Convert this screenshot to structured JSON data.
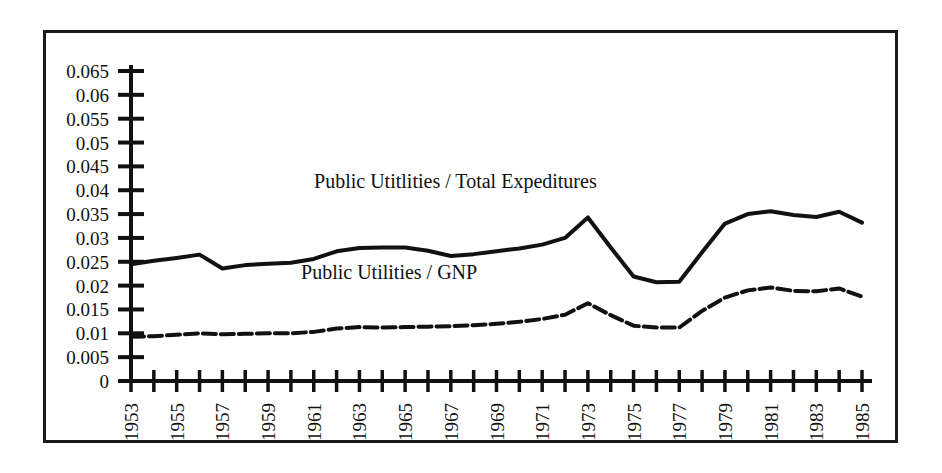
{
  "chart_data": {
    "type": "line",
    "title": "",
    "subtitle": "",
    "xlabel": "",
    "ylabel": "",
    "xlim": [
      1953,
      1985
    ],
    "ylim": [
      0,
      0.065
    ],
    "grid": false,
    "legend_position": "inline-annotation",
    "y_ticks": [
      "0",
      "0.005",
      "0.01",
      "0.015",
      "0.02",
      "0.025",
      "0.03",
      "0.035",
      "0.04",
      "0.045",
      "0.05",
      "0.055",
      "0.06",
      "0.065"
    ],
    "y_tick_values": [
      0,
      0.005,
      0.01,
      0.015,
      0.02,
      0.025,
      0.03,
      0.035,
      0.04,
      0.045,
      0.05,
      0.055,
      0.06,
      0.065
    ],
    "x_tick_values": [
      1953,
      1954,
      1955,
      1956,
      1957,
      1958,
      1959,
      1960,
      1961,
      1962,
      1963,
      1964,
      1965,
      1966,
      1967,
      1968,
      1969,
      1970,
      1971,
      1972,
      1973,
      1974,
      1975,
      1976,
      1977,
      1978,
      1979,
      1980,
      1981,
      1982,
      1983,
      1984,
      1985
    ],
    "x_tick_labels": [
      "1953",
      "",
      "1955",
      "",
      "1957",
      "",
      "1959",
      "",
      "1961",
      "",
      "1963",
      "",
      "1965",
      "",
      "1967",
      "",
      "1969",
      "",
      "1971",
      "",
      "1973",
      "",
      "1975",
      "",
      "1977",
      "",
      "1979",
      "",
      "1981",
      "",
      "1983",
      "",
      "1985"
    ],
    "x": [
      1953,
      1954,
      1955,
      1956,
      1957,
      1958,
      1959,
      1960,
      1961,
      1962,
      1963,
      1964,
      1965,
      1966,
      1967,
      1968,
      1969,
      1970,
      1971,
      1972,
      1973,
      1974,
      1975,
      1976,
      1977,
      1978,
      1979,
      1980,
      1981,
      1982,
      1983,
      1984,
      1985
    ],
    "series": [
      {
        "name": "Public Utitlities / Total Expeditures",
        "style": "solid",
        "color": "#111111",
        "width": 4,
        "label_x": 1967.2,
        "label_y": 0.0405,
        "values": [
          0.0245,
          0.0252,
          0.0258,
          0.0265,
          0.0236,
          0.0243,
          0.0246,
          0.0248,
          0.0256,
          0.0272,
          0.0279,
          0.028,
          0.028,
          0.0273,
          0.0262,
          0.0266,
          0.0272,
          0.0278,
          0.0286,
          0.03,
          0.0343,
          0.028,
          0.0219,
          0.0207,
          0.0208,
          0.027,
          0.033,
          0.035,
          0.0356,
          0.0348,
          0.0344,
          0.0355,
          0.0332
        ]
      },
      {
        "name": "Public Utilities / GNP",
        "style": "dashed",
        "color": "#111111",
        "width": 4,
        "label_x": 1964.3,
        "label_y": 0.0213,
        "values": [
          0.0093,
          0.0094,
          0.0097,
          0.01,
          0.0098,
          0.0099,
          0.01,
          0.01,
          0.0103,
          0.011,
          0.0113,
          0.0112,
          0.0113,
          0.0114,
          0.0115,
          0.0117,
          0.012,
          0.0124,
          0.013,
          0.0139,
          0.0163,
          0.0138,
          0.0116,
          0.0112,
          0.0112,
          0.0147,
          0.0175,
          0.019,
          0.0196,
          0.0189,
          0.0188,
          0.0194,
          0.0177
        ]
      }
    ]
  }
}
